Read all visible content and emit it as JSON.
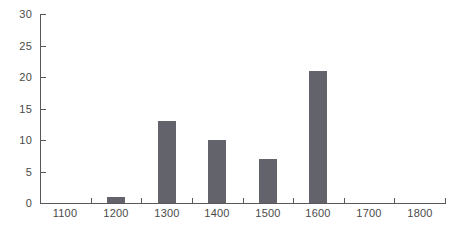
{
  "chart_data": {
    "type": "bar",
    "title": "",
    "subtitle": "",
    "xlabel": "",
    "ylabel": "",
    "categories": [
      "1100",
      "1200",
      "1300",
      "1400",
      "1500",
      "1600",
      "1700",
      "1800"
    ],
    "values": [
      0,
      1,
      13,
      10,
      7,
      21,
      0,
      0
    ],
    "ylim": [
      0,
      30
    ],
    "yticks": [
      "0",
      "5",
      "10",
      "15",
      "20",
      "25",
      "30"
    ],
    "ytick_values": [
      0,
      5,
      10,
      15,
      20,
      25,
      30
    ],
    "xticks": [
      "1100",
      "1200",
      "1300",
      "1400",
      "1500",
      "1600",
      "1700",
      "1800"
    ],
    "grid": false,
    "legend": false,
    "legend_position": "none",
    "bar_color": "#63636b",
    "axis_color": "#585858",
    "label_color": "#4a4a4a",
    "background_color": "#ffffff",
    "annotations": []
  }
}
